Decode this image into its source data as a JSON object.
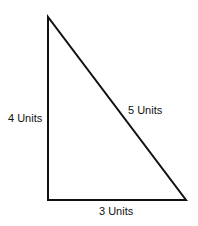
{
  "diagram": {
    "type": "right-triangle",
    "labels": {
      "left_side": "4 Units",
      "hypotenuse": "5 Units",
      "bottom_side": "3 Units"
    },
    "colors": {
      "stroke": "#111111",
      "background": "#ffffff"
    }
  }
}
